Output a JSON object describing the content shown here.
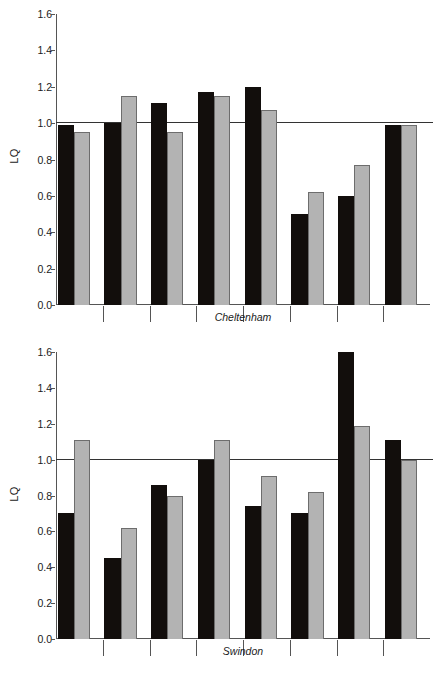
{
  "figure": {
    "y_axis_label": "LQ",
    "panels": [
      "Cheltenham",
      "Swindon"
    ]
  },
  "chart_data": [
    {
      "type": "bar",
      "title": "",
      "xlabel": "Cheltenham",
      "ylabel": "LQ",
      "ylim": [
        0.0,
        1.6
      ],
      "yticks": [
        "0.0",
        "0.2",
        "0.4",
        "0.6",
        "0.8",
        "1.0",
        "1.2",
        "1.4",
        "1.6"
      ],
      "ytick_values": [
        0.0,
        0.2,
        0.4,
        0.6,
        0.8,
        1.0,
        1.2,
        1.4,
        1.6
      ],
      "grid": false,
      "legend": "none",
      "reference_line": 1.0,
      "categories": [
        "1",
        "2",
        "3",
        "4",
        "5",
        "6",
        "7",
        "8"
      ],
      "series": [
        {
          "name": "black",
          "color": "#120e0c",
          "values": [
            0.99,
            1.0,
            1.11,
            1.17,
            1.2,
            0.5,
            0.6,
            0.99
          ]
        },
        {
          "name": "gray",
          "color": "#b3b3b3",
          "values": [
            0.95,
            1.15,
            0.95,
            1.15,
            1.07,
            0.62,
            0.77,
            0.99
          ]
        }
      ]
    },
    {
      "type": "bar",
      "title": "",
      "xlabel": "Swindon",
      "ylabel": "LQ",
      "ylim": [
        0.0,
        1.6
      ],
      "yticks": [
        "0.0",
        "0.2",
        "0.4",
        "0.6",
        "0.8",
        "1.0",
        "1.2",
        "1.4",
        "1.6"
      ],
      "ytick_values": [
        0.0,
        0.2,
        0.4,
        0.6,
        0.8,
        1.0,
        1.2,
        1.4,
        1.6
      ],
      "grid": false,
      "legend": "none",
      "reference_line": 1.0,
      "categories": [
        "1",
        "2",
        "3",
        "4",
        "5",
        "6",
        "7",
        "8"
      ],
      "series": [
        {
          "name": "black",
          "color": "#120e0c",
          "values": [
            0.7,
            0.45,
            0.86,
            1.0,
            0.74,
            0.7,
            1.6,
            1.11
          ]
        },
        {
          "name": "gray",
          "color": "#b3b3b3",
          "values": [
            1.11,
            0.62,
            0.8,
            1.11,
            0.91,
            0.82,
            1.19,
            1.0
          ]
        }
      ]
    }
  ]
}
